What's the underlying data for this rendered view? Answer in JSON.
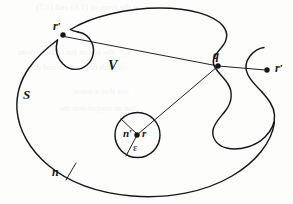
{
  "figure": {
    "type": "geometry-diagram",
    "background_color": "#fdfdfc",
    "ink_color": "#15161a",
    "labels": [
      {
        "id": "r-prime-top",
        "text": "r",
        "prime": "′",
        "x": 53,
        "y": 20,
        "meaning": "source point on surface (top-left indentation)"
      },
      {
        "id": "q",
        "text": "q",
        "prime": "",
        "x": 213,
        "y": 49,
        "meaning": "boundary point at S-shaped indentation"
      },
      {
        "id": "r-prime-right",
        "text": "r",
        "prime": "′",
        "x": 275,
        "y": 62,
        "meaning": "exterior field point"
      },
      {
        "id": "V",
        "text": "V",
        "prime": "",
        "x": 108,
        "y": 59,
        "meaning": "enclosed volume"
      },
      {
        "id": "S",
        "text": "S",
        "prime": "",
        "x": 23,
        "y": 88,
        "meaning": "bounding surface"
      },
      {
        "id": "n-prime",
        "text": "n",
        "prime": "′",
        "x": 123,
        "y": 128,
        "meaning": "inward normal on small sphere"
      },
      {
        "id": "r-center",
        "text": "r",
        "prime": "",
        "x": 142,
        "y": 128,
        "meaning": "singular / observation point"
      },
      {
        "id": "epsilon",
        "text": "ε",
        "prime": "",
        "x": 133,
        "y": 142,
        "meaning": "radius of excluded sphere"
      },
      {
        "id": "n-bottom",
        "text": "n",
        "prime": "",
        "x": 52,
        "y": 166,
        "meaning": "outward normal on surface S"
      }
    ],
    "points": [
      {
        "id": "point-r-prime-top",
        "x": 63,
        "y": 35,
        "r": 2.7
      },
      {
        "id": "point-q",
        "x": 218,
        "y": 66,
        "r": 2.7
      },
      {
        "id": "point-r-prime-right",
        "x": 267,
        "y": 70,
        "r": 2.7
      },
      {
        "id": "point-r-center",
        "x": 137,
        "y": 135,
        "r": 2.7
      }
    ],
    "ghost_text": [
      {
        "text": "n the form of (1.6) and (1.7)",
        "x": 36,
        "y": 2,
        "size": 9
      },
      {
        "text": "the is that for a Dirac delta",
        "x": 18,
        "y": 47,
        "size": 9
      },
      {
        "text": "which the surface and the",
        "x": 30,
        "y": 62,
        "size": 9
      },
      {
        "text": "see that a wave",
        "x": 74,
        "y": 86,
        "size": 9
      },
      {
        "text": "that an integral over the",
        "x": 60,
        "y": 104,
        "size": 8
      }
    ]
  }
}
